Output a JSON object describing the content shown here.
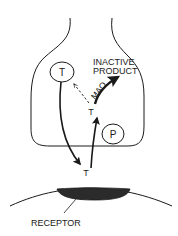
{
  "diagram": {
    "type": "synapse-neurotransmitter-cycle",
    "colors": {
      "line": "#1a1a1a",
      "receptor_fill": "#2b2b2b",
      "background": "#ffffff"
    },
    "vesicle": {
      "label": "T"
    },
    "transporter": {
      "label": "P"
    },
    "cytoplasm_transmitter": {
      "label": "T"
    },
    "cleft_transmitter": {
      "label": "T"
    },
    "enzyme": {
      "label": "MAO"
    },
    "product": {
      "line1": "INACTIVE",
      "line2": "PRODUCT"
    },
    "receptor": {
      "label": "RECEPTOR"
    }
  }
}
